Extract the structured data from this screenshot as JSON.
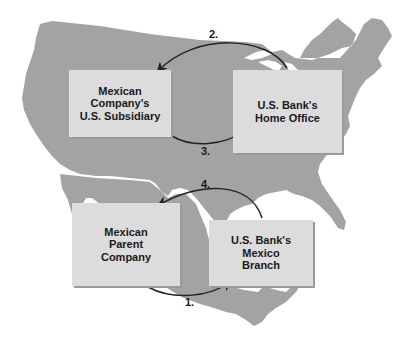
{
  "diagram": {
    "background_color": "#ffffff",
    "map_color": "#a3a3a3",
    "box_color": "#dcdcdc",
    "arrow_color": "#222222",
    "nodes": [
      {
        "id": "us_subsidiary",
        "lines": [
          "Mexican Company's",
          "U.S. Subsidiary"
        ]
      },
      {
        "id": "us_home_office",
        "lines": [
          "U.S. Bank's",
          "Home Office"
        ]
      },
      {
        "id": "mexican_parent",
        "lines": [
          "Mexican",
          "Parent",
          "Company"
        ]
      },
      {
        "id": "mexico_branch",
        "lines": [
          "U.S. Bank's",
          "Mexico",
          "Branch"
        ]
      }
    ],
    "edges": [
      {
        "label": "1.",
        "from": "mexican_parent",
        "to": "mexico_branch"
      },
      {
        "label": "2.",
        "from": "us_home_office",
        "to": "us_subsidiary"
      },
      {
        "label": "3.",
        "from": "us_subsidiary",
        "to": "us_home_office"
      },
      {
        "label": "4.",
        "from": "mexico_branch",
        "to": "mexican_parent"
      }
    ]
  }
}
